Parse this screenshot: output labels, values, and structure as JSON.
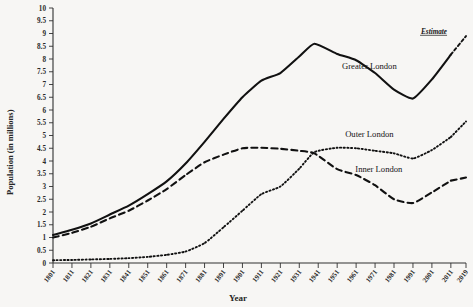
{
  "chart_data": {
    "type": "line",
    "title": "",
    "xlabel": "Year",
    "ylabel": "Population (in millions)",
    "ylim": [
      0,
      10
    ],
    "ytick_step": 0.5,
    "yticks": [
      "0",
      "0.5",
      "1",
      "1.5",
      "2",
      "2.5",
      "3",
      "3.5",
      "4",
      "4.5",
      "5",
      "5.5",
      "6",
      "6.5",
      "7",
      "7.5",
      "8",
      "8.5",
      "9",
      "9.5",
      "10"
    ],
    "xticks": [
      "1801",
      "1811",
      "1821",
      "1831",
      "1841",
      "1851",
      "1861",
      "1871",
      "1881",
      "1891",
      "1901",
      "1911",
      "1921",
      "1931",
      "1941",
      "1951",
      "1961",
      "1971",
      "1981",
      "1991",
      "2001",
      "2011",
      "2019"
    ],
    "xlim": [
      1801,
      2019
    ],
    "grid": false,
    "legend_position": "inline-labels",
    "annotations": [
      {
        "text": "Estimate",
        "x": 2009,
        "y": 9.0,
        "style": "italic-underline"
      }
    ],
    "series": [
      {
        "name": "Greater London",
        "style": "solid",
        "label_x": 1968,
        "label_y": 7.6,
        "x": [
          1801,
          1811,
          1821,
          1831,
          1841,
          1851,
          1861,
          1871,
          1881,
          1891,
          1901,
          1911,
          1921,
          1931,
          1939,
          1951,
          1961,
          1971,
          1981,
          1991,
          2001,
          2011,
          2019
        ],
        "values": [
          1.1,
          1.3,
          1.55,
          1.9,
          2.25,
          2.7,
          3.2,
          3.9,
          4.75,
          5.65,
          6.5,
          7.15,
          7.45,
          8.1,
          8.6,
          8.2,
          7.95,
          7.45,
          6.8,
          6.45,
          7.2,
          8.17,
          8.9
        ]
      },
      {
        "name": "Inner London",
        "style": "dashed",
        "label_x": 1973,
        "label_y": 3.55,
        "x": [
          1801,
          1811,
          1821,
          1831,
          1841,
          1851,
          1861,
          1871,
          1881,
          1891,
          1901,
          1911,
          1921,
          1931,
          1939,
          1951,
          1961,
          1971,
          1981,
          1991,
          2001,
          2011,
          2019
        ],
        "values": [
          1.0,
          1.18,
          1.42,
          1.75,
          2.05,
          2.45,
          2.9,
          3.45,
          3.95,
          4.25,
          4.5,
          4.52,
          4.48,
          4.4,
          4.3,
          3.68,
          3.45,
          3.05,
          2.5,
          2.35,
          2.77,
          3.23,
          3.35
        ]
      },
      {
        "name": "Outer London",
        "style": "dotted",
        "label_x": 1968,
        "label_y": 4.95,
        "x": [
          1801,
          1811,
          1821,
          1831,
          1841,
          1851,
          1861,
          1871,
          1881,
          1891,
          1901,
          1911,
          1921,
          1931,
          1939,
          1951,
          1961,
          1971,
          1981,
          1991,
          2001,
          2011,
          2019
        ],
        "values": [
          0.11,
          0.12,
          0.14,
          0.16,
          0.19,
          0.24,
          0.32,
          0.45,
          0.78,
          1.4,
          2.05,
          2.7,
          3.0,
          3.7,
          4.35,
          4.52,
          4.5,
          4.4,
          4.3,
          4.1,
          4.43,
          4.94,
          5.55
        ]
      }
    ]
  },
  "labels": {
    "greater_london": "Greater London",
    "inner_london": "Inner London",
    "outer_london": "Outer London",
    "estimate": "Estimate",
    "x_axis_title": "Year",
    "y_axis_title": "Population (in millions)"
  },
  "colors": {
    "background": "#f7f6f4",
    "ink": "#111111",
    "axis": "#303030"
  }
}
